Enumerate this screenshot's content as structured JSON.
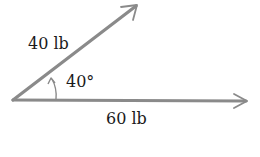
{
  "diagram": {
    "type": "force-vector-diagram",
    "vectors": [
      {
        "name": "upper-force",
        "label": "40 lb",
        "magnitude": 40,
        "unit": "lb",
        "angle_deg": 40,
        "start": [
          14,
          100
        ],
        "end": [
          137,
          5
        ]
      },
      {
        "name": "horizontal-force",
        "label": "60 lb",
        "magnitude": 60,
        "unit": "lb",
        "angle_deg": 0,
        "start": [
          14,
          100
        ],
        "end": [
          247,
          101
        ]
      }
    ],
    "angle": {
      "label": "40°",
      "value_deg": 40
    },
    "colors": {
      "vector_stroke": "#8a8a8a",
      "text": "#1a1a1a",
      "background": "#ffffff"
    }
  }
}
